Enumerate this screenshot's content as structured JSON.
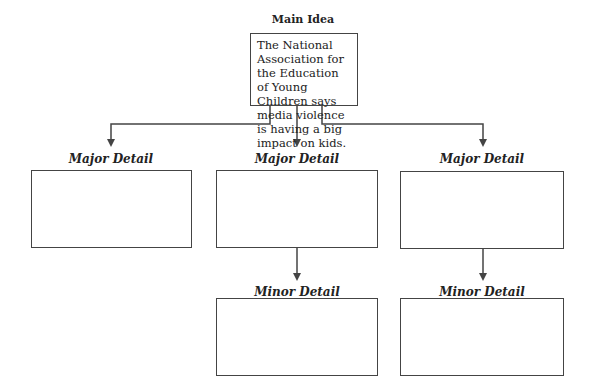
{
  "main": {
    "title": "Main Idea",
    "text": "The National Association for the Education of Young Children says media violence is having a big impact on kids."
  },
  "major_details": [
    {
      "label": "Major Detail",
      "text": ""
    },
    {
      "label": "Major Detail",
      "text": ""
    },
    {
      "label": "Major Detail",
      "text": ""
    }
  ],
  "minor_details": [
    {
      "label": "Minor Detail",
      "text": ""
    },
    {
      "label": "Minor Detail",
      "text": ""
    }
  ],
  "colors": {
    "line": "#444444",
    "text": "#222222",
    "background": "#ffffff"
  }
}
